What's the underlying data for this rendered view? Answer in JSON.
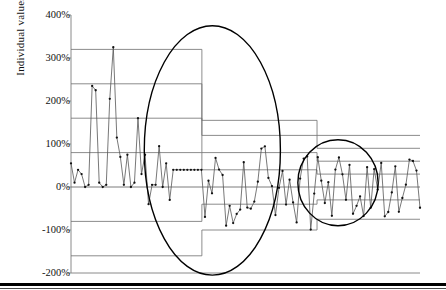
{
  "figure": {
    "bottom_rule": "thick-black-rule"
  },
  "chart_data": {
    "type": "line",
    "title": "",
    "xlabel": "",
    "ylabel": "Individual values",
    "ylim": [
      -200,
      400
    ],
    "xlim": [
      0,
      100
    ],
    "grid": false,
    "yticks": [
      400,
      300,
      200,
      100,
      0,
      -100,
      -200
    ],
    "ytick_labels": [
      "400%",
      "300%",
      "200%",
      "100%",
      "0%",
      "-100%",
      "-200%"
    ],
    "legend": "none",
    "colors": {
      "series_line": "#555555",
      "marker": "#111111",
      "limit_line": "#6e6e6e",
      "annotation_ellipse": "#000000",
      "axis": "#888888",
      "text": "#111111"
    },
    "series": [
      {
        "name": "Individual values",
        "marker": "dot",
        "values": [
          55,
          10,
          40,
          30,
          0,
          5,
          235,
          225,
          10,
          0,
          5,
          205,
          325,
          115,
          70,
          5,
          75,
          0,
          10,
          160,
          30,
          75,
          -40,
          5,
          5,
          95,
          0,
          55,
          -30,
          40
        ]
      }
    ],
    "annotations": [
      {
        "name": "variation-reduction-ellipse-1",
        "shape": "ellipse",
        "cx_pct": 40.5,
        "cy_value": 85,
        "rx_pct": 19.5,
        "ry_value": 290
      },
      {
        "name": "variation-reduction-ellipse-2",
        "shape": "ellipse",
        "cx_pct": 76.5,
        "cy_value": 10,
        "rx_pct": 11.5,
        "ry_value": 100
      }
    ],
    "control_limits": {
      "description": "Stepped control limits recalculated for three process phases",
      "phases": [
        {
          "name": "phase-1",
          "x_start_pct": 0,
          "x_end_pct": 37.5,
          "ucl": 320,
          "usl2": 240,
          "usl1": 160,
          "usl0": 80,
          "center": 0,
          "lsl1": -80,
          "lsl2": -160
        },
        {
          "name": "phase-2",
          "x_start_pct": 37.5,
          "x_end_pct": 70.5,
          "ucl": 155,
          "usl2": 120,
          "usl1": 80,
          "usl0": 40,
          "center": 0,
          "lsl1": -40,
          "lsl2": -100
        },
        {
          "name": "phase-3",
          "x_start_pct": 70.5,
          "x_end_pct": 100,
          "ucl": 120,
          "usl2": 90,
          "usl1": 60,
          "usl0": 30,
          "center": 0,
          "lsl1": -30,
          "lsl2": -75
        }
      ]
    }
  }
}
